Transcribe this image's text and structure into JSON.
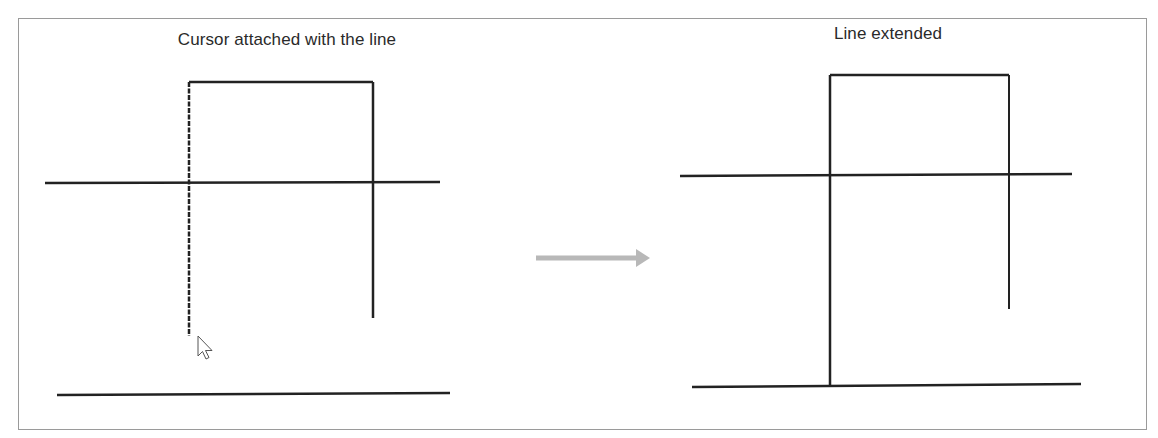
{
  "frame": {
    "x": 18,
    "y": 18,
    "width": 1129,
    "height": 412,
    "border_color": "#9a9a9a"
  },
  "panels": {
    "before": {
      "title": "Cursor attached with the line",
      "title_x": 287,
      "title_y": 42,
      "line_color": "#222222",
      "lines": [
        {
          "id": "top-horizontal-segment",
          "x1": 189,
          "y1": 82,
          "x2": 373,
          "y2": 82,
          "width": 2.5,
          "dashed": false
        },
        {
          "id": "left-vertical-segment-attached",
          "x1": 189,
          "y1": 82,
          "x2": 189,
          "y2": 336,
          "width": 2.5,
          "dashed": true
        },
        {
          "id": "right-vertical-segment",
          "x1": 373,
          "y1": 82,
          "x2": 373,
          "y2": 318,
          "width": 2.5,
          "dashed": false
        },
        {
          "id": "middle-horizontal-line",
          "x1": 45,
          "y1": 183,
          "x2": 440,
          "y2": 182,
          "width": 2.5,
          "dashed": false
        },
        {
          "id": "bottom-boundary-line",
          "x1": 57,
          "y1": 395,
          "x2": 450,
          "y2": 393,
          "width": 2.5,
          "dashed": false
        }
      ],
      "cursor": {
        "icon": "arrow-pointer",
        "x": 198,
        "y": 336
      }
    },
    "arrow": {
      "x1": 536,
      "y1": 258,
      "x2": 650,
      "y2": 258,
      "color": "#b8b8b8",
      "icon": "right-arrow"
    },
    "after": {
      "title": "Line extended",
      "title_x": 888,
      "title_y": 36,
      "line_color": "#222222",
      "lines": [
        {
          "id": "top-horizontal-segment",
          "x1": 830,
          "y1": 75,
          "x2": 1009,
          "y2": 75,
          "width": 2.5,
          "dashed": false
        },
        {
          "id": "left-vertical-segment-extended",
          "x1": 830,
          "y1": 75,
          "x2": 830,
          "y2": 386,
          "width": 2.5,
          "dashed": false
        },
        {
          "id": "right-vertical-segment",
          "x1": 1009,
          "y1": 75,
          "x2": 1009,
          "y2": 309,
          "width": 2,
          "dashed": false
        },
        {
          "id": "middle-horizontal-line",
          "x1": 680,
          "y1": 176,
          "x2": 1072,
          "y2": 174,
          "width": 2.5,
          "dashed": false
        },
        {
          "id": "bottom-boundary-line",
          "x1": 692,
          "y1": 387,
          "x2": 1081,
          "y2": 384,
          "width": 2.5,
          "dashed": false
        }
      ]
    }
  }
}
